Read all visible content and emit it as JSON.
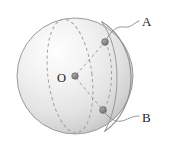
{
  "figure": {
    "type": "geometry-diagram",
    "background_color": "#ffffff",
    "width": 170,
    "height": 148
  },
  "labels": {
    "point_a": "A",
    "point_b": "B",
    "center": "O"
  },
  "geometry": {
    "sphere": {
      "center": {
        "x": 75,
        "y": 76
      },
      "radius": 58,
      "fill_light": "#fdfdfd",
      "fill_mid": "#e8e8e8",
      "fill_dark": "#c9c9c9",
      "outline_color": "#9a9a9a"
    },
    "points": [
      {
        "name": "A",
        "x": 105,
        "y": 42,
        "marker_color": "#8a8a8a"
      },
      {
        "name": "B",
        "x": 103,
        "y": 110,
        "marker_color": "#8a8a8a"
      },
      {
        "name": "O",
        "x": 75,
        "y": 76,
        "marker_color": "#8a8a8a"
      }
    ],
    "radii": [
      {
        "from": "O",
        "to": "A",
        "style": "dashed"
      },
      {
        "from": "O",
        "to": "B",
        "style": "dashed"
      }
    ],
    "arcs": [
      {
        "name": "great-circle-through-A-and-B",
        "style": "solid",
        "color": "#8f8f8f"
      },
      {
        "name": "great-circle-left-ellipse",
        "style": "dashed",
        "color": "#9e9e9e"
      },
      {
        "name": "small-arc-A-to-B",
        "style": "dashed",
        "color": "#9e9e9e"
      }
    ],
    "leaders": [
      {
        "label": "A",
        "style": "wavy",
        "color": "#8a8a8a"
      },
      {
        "label": "B",
        "style": "wavy",
        "color": "#8a8a8a"
      }
    ]
  }
}
